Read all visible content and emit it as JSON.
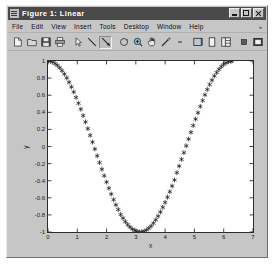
{
  "window": {
    "title": "Figure 1: Linear",
    "title_icon": "figure-window-icon",
    "controls": [
      {
        "name": "minimize-button",
        "glyph": "minimize"
      },
      {
        "name": "maximize-button",
        "glyph": "maximize"
      },
      {
        "name": "close-button",
        "glyph": "close"
      }
    ]
  },
  "menubar": {
    "items": [
      {
        "label": "File"
      },
      {
        "label": "Edit"
      },
      {
        "label": "View"
      },
      {
        "label": "Insert"
      },
      {
        "label": "Tools"
      },
      {
        "label": "Desktop"
      },
      {
        "label": "Window"
      },
      {
        "label": "Help"
      }
    ],
    "overflow_glyph": "»"
  },
  "toolbar": {
    "buttons": [
      {
        "name": "new-figure-icon",
        "glyph": "◱",
        "selected": false
      },
      {
        "name": "open-file-icon",
        "glyph": "◳",
        "selected": false
      },
      {
        "name": "save-figure-icon",
        "glyph": "▣",
        "selected": false
      },
      {
        "name": "print-figure-icon",
        "glyph": "⎙",
        "selected": false
      },
      {
        "name": "edit-plot-arrow-icon",
        "glyph": "↖",
        "selected": false
      },
      {
        "name": "insert-line-icon",
        "glyph": "╲",
        "selected": false
      },
      {
        "name": "insert-arrow-icon",
        "glyph": "╲",
        "selected": true
      },
      {
        "name": "rotate-3d-icon",
        "glyph": "↻",
        "selected": false
      },
      {
        "name": "zoom-in-icon",
        "glyph": "⊕",
        "selected": false
      },
      {
        "name": "pan-icon",
        "glyph": "✋",
        "selected": false
      },
      {
        "name": "data-cursor-icon",
        "glyph": "✐",
        "selected": false
      },
      {
        "name": "toolbar-dropdown-icon",
        "glyph": "•",
        "selected": false
      },
      {
        "name": "insert-colorbar-icon",
        "glyph": "▤",
        "selected": false
      },
      {
        "name": "insert-legend-icon",
        "glyph": "▯",
        "selected": false
      },
      {
        "name": "plot-browser-icon",
        "glyph": "▦",
        "selected": false
      },
      {
        "name": "hide-plot-tools-icon",
        "glyph": "▪",
        "selected": false
      },
      {
        "name": "show-plot-tools-icon",
        "glyph": "▣",
        "selected": false
      }
    ]
  },
  "chart_data": {
    "type": "scatter",
    "title": "",
    "xlabel": "x",
    "ylabel": "y",
    "xlim": [
      0,
      7
    ],
    "ylim": [
      -1,
      1
    ],
    "xticks": [
      0,
      1,
      2,
      3,
      4,
      5,
      6,
      7
    ],
    "xticklabels": [
      "0",
      "1",
      "2",
      "3",
      "4",
      "5",
      "6",
      "7"
    ],
    "yticks": [
      -1,
      -0.8,
      -0.6,
      -0.4,
      -0.2,
      0,
      0.2,
      0.4,
      0.6,
      0.8,
      1
    ],
    "yticklabels": [
      "-1",
      "-0.8",
      "-0.6",
      "-0.4",
      "-0.2",
      "0",
      "0.2",
      "0.4",
      "0.6",
      "0.8",
      "1"
    ],
    "grid": false,
    "legend": null,
    "marker": "asterisk",
    "marker_color": "#1a1a1a",
    "series": [
      {
        "name": "cos(x)",
        "x": [
          0.0,
          0.08,
          0.16,
          0.24,
          0.32,
          0.4,
          0.48,
          0.56,
          0.64,
          0.72,
          0.8,
          0.88,
          0.96,
          1.04,
          1.12,
          1.2,
          1.28,
          1.36,
          1.44,
          1.52,
          1.6,
          1.68,
          1.76,
          1.84,
          1.92,
          2.0,
          2.08,
          2.16,
          2.24,
          2.32,
          2.4,
          2.48,
          2.56,
          2.64,
          2.72,
          2.8,
          2.88,
          2.96,
          3.04,
          3.12,
          3.2,
          3.28,
          3.36,
          3.44,
          3.52,
          3.6,
          3.68,
          3.76,
          3.84,
          3.92,
          4.0,
          4.08,
          4.16,
          4.24,
          4.32,
          4.4,
          4.48,
          4.56,
          4.64,
          4.72,
          4.8,
          4.88,
          4.96,
          5.04,
          5.12,
          5.2,
          5.28,
          5.36,
          5.44,
          5.52,
          5.6,
          5.68,
          5.76,
          5.84,
          5.92,
          6.0,
          6.08,
          6.16,
          6.24,
          6.28
        ],
        "y": [
          1.0,
          0.997,
          0.987,
          0.971,
          0.949,
          0.921,
          0.887,
          0.847,
          0.802,
          0.752,
          0.697,
          0.637,
          0.574,
          0.506,
          0.436,
          0.362,
          0.287,
          0.209,
          0.13,
          0.051,
          -0.029,
          -0.109,
          -0.188,
          -0.266,
          -0.342,
          -0.416,
          -0.488,
          -0.556,
          -0.622,
          -0.683,
          -0.737,
          -0.796,
          -0.838,
          -0.879,
          -0.913,
          -0.942,
          -0.966,
          -0.983,
          -0.994,
          -1.0,
          -0.998,
          -0.991,
          -0.977,
          -0.957,
          -0.932,
          -0.897,
          -0.858,
          -0.815,
          -0.765,
          -0.711,
          -0.654,
          -0.593,
          -0.529,
          -0.462,
          -0.392,
          -0.307,
          -0.229,
          -0.151,
          -0.072,
          0.008,
          0.087,
          0.166,
          0.245,
          0.321,
          0.395,
          0.469,
          0.538,
          0.604,
          0.667,
          0.725,
          0.776,
          0.825,
          0.866,
          0.903,
          0.935,
          0.96,
          0.979,
          0.992,
          0.999,
          1.0
        ]
      }
    ]
  }
}
